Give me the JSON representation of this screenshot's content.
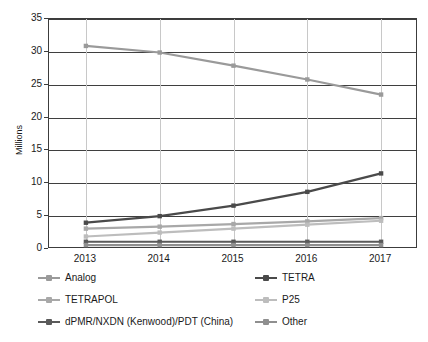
{
  "chart_data": {
    "type": "line",
    "title": "",
    "xlabel": "",
    "ylabel": "Millions",
    "categories": [
      "2013",
      "2014",
      "2015",
      "2016",
      "2017"
    ],
    "ylim": [
      0,
      35
    ],
    "yticks": [
      0,
      5,
      10,
      15,
      20,
      25,
      30,
      35
    ],
    "grid": true,
    "legend_position": "bottom",
    "series": [
      {
        "name": "Analog",
        "color": "#9a9a9a",
        "values": [
          30.9,
          29.9,
          27.9,
          25.8,
          23.5
        ]
      },
      {
        "name": "TETRA",
        "color": "#4a4a4a",
        "values": [
          4.0,
          5.0,
          6.6,
          8.7,
          11.5
        ]
      },
      {
        "name": "TETRAPOL",
        "color": "#a8a8a8",
        "values": [
          3.1,
          3.4,
          3.8,
          4.2,
          4.7
        ]
      },
      {
        "name": "P25",
        "color": "#bdbdbd",
        "values": [
          1.9,
          2.5,
          3.1,
          3.7,
          4.3
        ]
      },
      {
        "name": "dPMR/NXDN (Kenwood)/PDT (China)",
        "color": "#5a5a5a",
        "values": [
          1.1,
          1.1,
          1.1,
          1.1,
          1.1
        ]
      },
      {
        "name": "Other",
        "color": "#8f8f8f",
        "values": [
          0.6,
          0.6,
          0.6,
          0.6,
          0.6
        ]
      }
    ]
  },
  "legend": {
    "items": [
      {
        "label": "Analog",
        "color": "#9a9a9a"
      },
      {
        "label": "TETRA",
        "color": "#4a4a4a"
      },
      {
        "label": "TETRAPOL",
        "color": "#a8a8a8"
      },
      {
        "label": "P25",
        "color": "#bdbdbd"
      },
      {
        "label": "dPMR/NXDN (Kenwood)/PDT (China)",
        "color": "#5a5a5a"
      },
      {
        "label": "Other",
        "color": "#8f8f8f"
      }
    ]
  }
}
